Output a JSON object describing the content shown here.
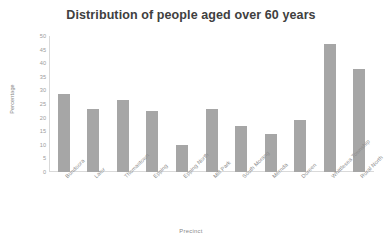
{
  "chart_data": {
    "type": "bar",
    "title": "Distribution of people aged over 60 years",
    "xlabel": "Precinct",
    "ylabel": "Percentage",
    "categories": [
      "Bundoora",
      "Lalor",
      "Thomastown",
      "Epping",
      "Epping North",
      "Mill Park",
      "South Morang",
      "Mernda",
      "Doreen",
      "Whittlesea Township",
      "Rural North"
    ],
    "values": [
      28.5,
      23,
      26.5,
      22.5,
      10,
      23,
      17,
      14,
      19,
      47,
      38
    ],
    "ylim": [
      0,
      50
    ],
    "ytick_labels": [
      "50",
      "45",
      "40",
      "35",
      "30",
      "25",
      "20",
      "15",
      "10",
      "5",
      "0"
    ],
    "ytick_values": [
      50,
      45,
      40,
      35,
      30,
      25,
      20,
      15,
      10,
      5,
      0
    ],
    "grid": false,
    "legend": false,
    "bar_color": "#a6a6a6",
    "axis_color": "#d9d9d9",
    "title_color": "#404040",
    "label_color": "#8c8c8c"
  }
}
